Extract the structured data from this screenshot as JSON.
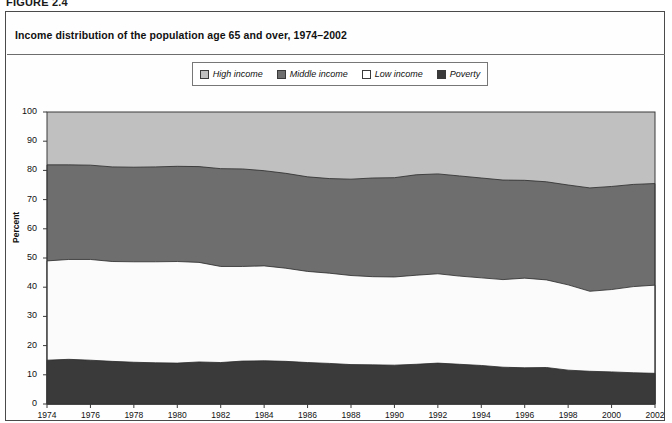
{
  "figure": {
    "label": "FIGURE 2.4",
    "title": "Income distribution of the population age 65 and over, 1974–2002"
  },
  "legend": {
    "items": [
      {
        "label": "High income",
        "color": "#c0c0c0",
        "name": "legend-swatch-high-income"
      },
      {
        "label": "Middle income",
        "color": "#6e6e6e",
        "name": "legend-swatch-middle-income"
      },
      {
        "label": "Low income",
        "color": "#ffffff",
        "name": "legend-swatch-low-income"
      },
      {
        "label": "Poverty",
        "color": "#3a3a3a",
        "name": "legend-swatch-poverty"
      }
    ]
  },
  "axes": {
    "ylabel": "Percent",
    "yticks": [
      "0",
      "10",
      "20",
      "30",
      "40",
      "50",
      "60",
      "70",
      "80",
      "90",
      "100"
    ],
    "xticks": [
      "1974",
      "1976",
      "1978",
      "1980",
      "1982",
      "1984",
      "1986",
      "1988",
      "1990",
      "1992",
      "1994",
      "1996",
      "1998",
      "2000",
      "2002"
    ]
  },
  "chart_data": {
    "type": "area",
    "title": "Income distribution of the population age 65 and over, 1974–2002",
    "xlabel": "",
    "ylabel": "Percent",
    "ylim": [
      0,
      100
    ],
    "xlim": [
      1974,
      2002
    ],
    "grid": false,
    "stacked": true,
    "stack_order_bottom_to_top": [
      "Poverty",
      "Low income",
      "Middle income",
      "High income"
    ],
    "legend_position": "top-center",
    "x": [
      1974,
      1975,
      1976,
      1977,
      1978,
      1979,
      1980,
      1981,
      1982,
      1983,
      1984,
      1985,
      1986,
      1987,
      1988,
      1989,
      1990,
      1991,
      1992,
      1993,
      1994,
      1995,
      1996,
      1997,
      1998,
      1999,
      2000,
      2001,
      2002
    ],
    "series": [
      {
        "name": "Poverty",
        "color": "#3a3a3a",
        "values": [
          15.0,
          15.3,
          15.0,
          14.6,
          14.3,
          14.1,
          14.0,
          14.4,
          14.2,
          14.7,
          14.8,
          14.6,
          14.2,
          13.9,
          13.5,
          13.4,
          13.3,
          13.6,
          14.0,
          13.6,
          13.2,
          12.6,
          12.4,
          12.5,
          11.6,
          11.2,
          11.0,
          10.7,
          10.5
        ]
      },
      {
        "name": "Low income",
        "color": "#ffffff",
        "values": [
          34.0,
          34.2,
          34.5,
          34.2,
          34.4,
          34.6,
          34.8,
          34.1,
          32.9,
          32.4,
          32.5,
          31.9,
          31.2,
          30.9,
          30.5,
          30.2,
          30.2,
          30.5,
          30.6,
          30.2,
          30.0,
          30.0,
          30.7,
          30.0,
          29.2,
          27.4,
          28.2,
          29.5,
          30.2
        ]
      },
      {
        "name": "Middle income",
        "color": "#6e6e6e",
        "values": [
          32.9,
          32.4,
          32.3,
          32.4,
          32.4,
          32.5,
          32.6,
          32.8,
          33.5,
          33.4,
          32.6,
          32.5,
          32.4,
          32.4,
          33.0,
          33.8,
          34.0,
          34.4,
          34.2,
          34.3,
          34.2,
          34.1,
          33.5,
          33.6,
          34.2,
          35.4,
          35.3,
          35.0,
          34.8
        ]
      },
      {
        "name": "High income",
        "color": "#c0c0c0",
        "values": [
          18.1,
          18.1,
          18.2,
          18.8,
          18.9,
          18.8,
          18.6,
          18.7,
          19.4,
          19.5,
          20.1,
          21.0,
          22.2,
          22.8,
          23.0,
          22.6,
          22.5,
          21.5,
          21.2,
          21.9,
          22.6,
          23.3,
          23.4,
          23.9,
          25.0,
          26.0,
          25.5,
          24.8,
          24.5
        ]
      }
    ],
    "cumulative_top_boundaries": {
      "poverty_top": [
        15.0,
        15.3,
        15.0,
        14.6,
        14.3,
        14.1,
        14.0,
        14.4,
        14.2,
        14.7,
        14.8,
        14.6,
        14.2,
        13.9,
        13.5,
        13.4,
        13.3,
        13.6,
        14.0,
        13.6,
        13.2,
        12.6,
        12.4,
        12.5,
        11.6,
        11.2,
        11.0,
        10.7,
        10.5
      ],
      "low_income_top": [
        49.0,
        49.5,
        49.5,
        48.8,
        48.7,
        48.7,
        48.8,
        48.5,
        47.1,
        47.1,
        47.3,
        46.5,
        45.4,
        44.8,
        44.0,
        43.6,
        43.5,
        44.1,
        44.6,
        43.8,
        43.2,
        42.6,
        43.1,
        42.5,
        40.8,
        38.6,
        39.2,
        40.2,
        40.7
      ],
      "middle_income_top": [
        81.9,
        81.9,
        81.8,
        81.2,
        81.1,
        81.2,
        81.4,
        81.3,
        80.6,
        80.5,
        79.9,
        79.0,
        77.8,
        77.2,
        77.0,
        77.4,
        77.5,
        78.5,
        78.8,
        78.1,
        77.4,
        76.7,
        76.6,
        76.1,
        75.0,
        74.0,
        74.5,
        75.2,
        75.5
      ],
      "high_income_top": [
        100,
        100,
        100,
        100,
        100,
        100,
        100,
        100,
        100,
        100,
        100,
        100,
        100,
        100,
        100,
        100,
        100,
        100,
        100,
        100,
        100,
        100,
        100,
        100,
        100,
        100,
        100,
        100,
        100
      ]
    }
  }
}
